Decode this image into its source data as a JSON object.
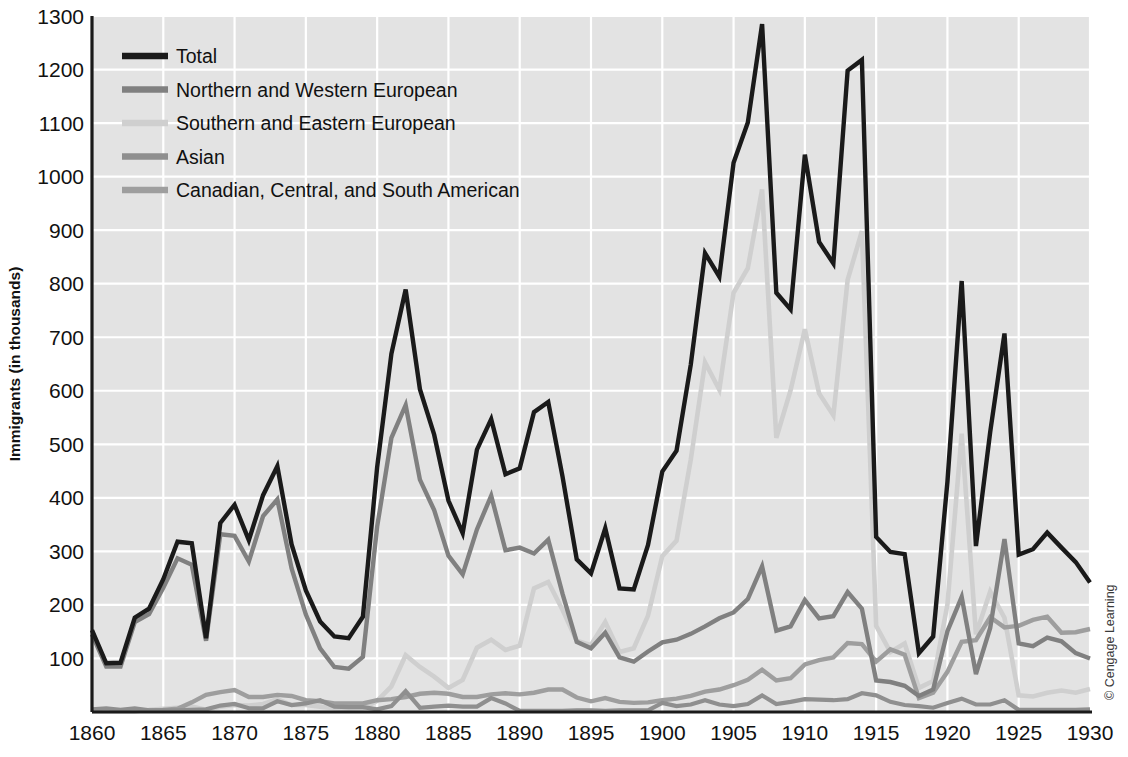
{
  "chart_data": {
    "type": "line",
    "title": "",
    "xlabel": "",
    "ylabel": "Immigrants (in thousands)",
    "xlim": [
      1860,
      1930
    ],
    "ylim": [
      0,
      1300
    ],
    "xticks": [
      1860,
      1865,
      1870,
      1875,
      1880,
      1885,
      1890,
      1895,
      1900,
      1905,
      1910,
      1915,
      1920,
      1925,
      1930
    ],
    "yticks": [
      100,
      200,
      300,
      400,
      500,
      600,
      700,
      800,
      900,
      1000,
      1100,
      1200,
      1300
    ],
    "grid": true,
    "legend_position": "top-left",
    "x": [
      1860,
      1861,
      1862,
      1863,
      1864,
      1865,
      1866,
      1867,
      1868,
      1869,
      1870,
      1871,
      1872,
      1873,
      1874,
      1875,
      1876,
      1877,
      1878,
      1879,
      1880,
      1881,
      1882,
      1883,
      1884,
      1885,
      1886,
      1887,
      1888,
      1889,
      1890,
      1891,
      1892,
      1893,
      1894,
      1895,
      1896,
      1897,
      1898,
      1899,
      1900,
      1901,
      1902,
      1903,
      1904,
      1905,
      1906,
      1907,
      1908,
      1909,
      1910,
      1911,
      1912,
      1913,
      1914,
      1915,
      1916,
      1917,
      1918,
      1919,
      1920,
      1921,
      1922,
      1923,
      1924,
      1925,
      1926,
      1927,
      1928,
      1929,
      1930
    ],
    "series": [
      {
        "name": "Total",
        "color": "#1a1a1a",
        "values": [
          153,
          91,
          92,
          176,
          193,
          248,
          318,
          315,
          138,
          353,
          387,
          321,
          405,
          459,
          313,
          227,
          169,
          141,
          138,
          178,
          457,
          669,
          789,
          603,
          518,
          395,
          334,
          490,
          547,
          444,
          455,
          560,
          579,
          440,
          285,
          259,
          343,
          231,
          229,
          312,
          449,
          488,
          649,
          857,
          813,
          1026,
          1101,
          1285,
          783,
          752,
          1041,
          878,
          838,
          1198,
          1218,
          327,
          299,
          295,
          110,
          141,
          430,
          805,
          310,
          523,
          707,
          294,
          304,
          335,
          307,
          280,
          242
        ]
      },
      {
        "name": "Northern and Western European",
        "color": "#808080",
        "values": [
          145,
          85,
          85,
          168,
          183,
          232,
          287,
          275,
          133,
          332,
          329,
          281,
          366,
          397,
          268,
          182,
          119,
          84,
          81,
          103,
          346,
          512,
          573,
          434,
          377,
          292,
          257,
          341,
          404,
          302,
          307,
          296,
          322,
          221,
          131,
          119,
          148,
          102,
          94,
          113,
          130,
          135,
          146,
          160,
          175,
          186,
          211,
          272,
          152,
          160,
          209,
          175,
          179,
          224,
          193,
          59,
          56,
          49,
          30,
          42,
          151,
          215,
          71,
          157,
          323,
          128,
          123,
          139,
          132,
          110,
          100
        ]
      },
      {
        "name": "Southern and Eastern European",
        "color": "#cfcfcf",
        "values": [
          4,
          3,
          3,
          3,
          4,
          6,
          8,
          10,
          4,
          10,
          13,
          12,
          15,
          24,
          13,
          13,
          10,
          7,
          6,
          7,
          21,
          48,
          106,
          84,
          66,
          45,
          60,
          120,
          135,
          116,
          124,
          231,
          243,
          191,
          133,
          125,
          168,
          112,
          119,
          180,
          291,
          320,
          472,
          653,
          602,
          783,
          829,
          976,
          512,
          601,
          715,
          595,
          554,
          807,
          898,
          161,
          112,
          128,
          45,
          58,
          201,
          520,
          145,
          225,
          176,
          31,
          29,
          36,
          40,
          36,
          43
        ]
      },
      {
        "name": "Asian",
        "color": "#8f8f8f",
        "values": [
          5,
          7,
          4,
          7,
          3,
          3,
          3,
          4,
          5,
          12,
          15,
          7,
          7,
          20,
          13,
          16,
          22,
          10,
          9,
          9,
          5,
          11,
          39,
          8,
          10,
          12,
          10,
          10,
          26,
          16,
          2,
          2,
          2,
          2,
          3,
          3,
          2,
          3,
          3,
          3,
          17,
          11,
          14,
          22,
          14,
          11,
          15,
          31,
          15,
          19,
          24,
          23,
          22,
          24,
          35,
          31,
          19,
          13,
          11,
          8,
          17,
          25,
          14,
          14,
          22,
          4,
          4,
          4,
          4,
          4,
          5
        ]
      },
      {
        "name": "Canadian, Central, and South American",
        "color": "#9e9e9e",
        "values": [
          2,
          2,
          2,
          2,
          3,
          4,
          6,
          18,
          32,
          37,
          41,
          28,
          28,
          32,
          30,
          22,
          20,
          16,
          16,
          16,
          22,
          24,
          28,
          34,
          36,
          34,
          28,
          28,
          33,
          35,
          33,
          36,
          42,
          42,
          27,
          20,
          26,
          19,
          17,
          18,
          22,
          25,
          30,
          38,
          42,
          50,
          60,
          79,
          59,
          63,
          89,
          97,
          102,
          129,
          127,
          94,
          117,
          107,
          26,
          36,
          75,
          131,
          134,
          177,
          158,
          161,
          172,
          178,
          148,
          149,
          155
        ]
      }
    ]
  },
  "legend": {
    "items": [
      {
        "label": "Total",
        "color": "#1a1a1a"
      },
      {
        "label": "Northern and Western European",
        "color": "#808080"
      },
      {
        "label": "Southern and Eastern European",
        "color": "#cfcfcf"
      },
      {
        "label": "Asian",
        "color": "#8f8f8f"
      },
      {
        "label": "Canadian, Central, and South American",
        "color": "#9e9e9e"
      }
    ]
  },
  "credit": "© Cengage Learning",
  "colors": {
    "plot_background": "#e3e3e3",
    "gridline": "#ffffff",
    "axis": "#1a1a1a",
    "page_background": "#ffffff"
  }
}
